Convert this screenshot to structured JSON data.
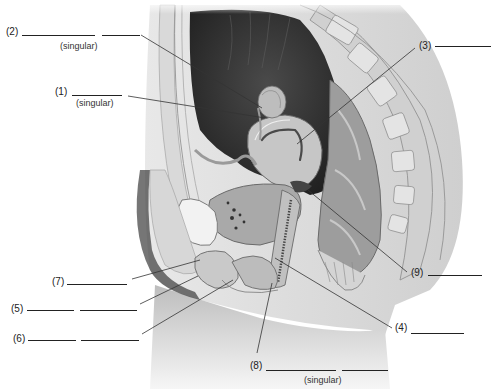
{
  "diagram": {
    "colors": {
      "ink": "#222222",
      "cavity": "#2a2a2a",
      "tissue": "#bdbdbd",
      "background": "#ffffff"
    },
    "labels": [
      {
        "id": "1",
        "number": "(1)",
        "blanks": 1,
        "note": "(singular)",
        "points_to": "ovary"
      },
      {
        "id": "2",
        "number": "(2)",
        "blanks": 2,
        "note": "(singular)",
        "points_to": "uterine tube fimbriae"
      },
      {
        "id": "3",
        "number": "(3)",
        "blanks": 1,
        "note": "",
        "points_to": "uterus"
      },
      {
        "id": "4",
        "number": "(4)",
        "blanks": 1,
        "note": "",
        "points_to": "vagina"
      },
      {
        "id": "5",
        "number": "(5)",
        "blanks": 2,
        "note": "",
        "points_to": "labium minus"
      },
      {
        "id": "6",
        "number": "(6)",
        "blanks": 2,
        "note": "",
        "points_to": "labium majus"
      },
      {
        "id": "7",
        "number": "(7)",
        "blanks": 1,
        "note": "",
        "points_to": "clitoris"
      },
      {
        "id": "8",
        "number": "(8)",
        "blanks": 2,
        "note": "(singular)",
        "points_to": "vaginal orifice / hymen"
      },
      {
        "id": "9",
        "number": "(9)",
        "blanks": 1,
        "note": "",
        "points_to": "cervix"
      }
    ]
  }
}
